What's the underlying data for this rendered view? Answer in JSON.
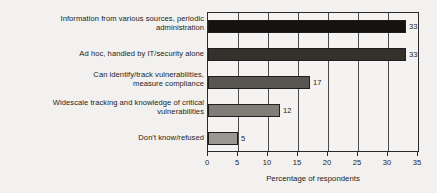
{
  "chart_data": {
    "type": "bar",
    "orientation": "horizontal",
    "title": "",
    "xlabel": "Percentage of respondents",
    "ylabel": "",
    "xlim": [
      0,
      35
    ],
    "xticks": [
      0,
      5,
      10,
      15,
      20,
      25,
      30,
      35
    ],
    "grid": "vertical",
    "legend": "none",
    "categories": [
      "Information from various sources, periodic administration",
      "Ad hoc, handled by IT/security alone",
      "Can identify/track vulnerabilities, measure compliance",
      "Widescale tracking and knowledge of critical vulnerabilities",
      "Don't know/refused"
    ],
    "category_lines": [
      [
        "Information from various sources, periodic",
        "administration"
      ],
      [
        "Ad hoc, handled by IT/security alone"
      ],
      [
        "Can identify/track vulnerabilities,",
        "measure compliance"
      ],
      [
        "Widescale tracking and knowledge of critical",
        "vulnerabilities"
      ],
      [
        "Don't know/refused"
      ]
    ],
    "values": [
      33,
      33,
      17,
      12,
      5
    ],
    "value_labels": [
      "33",
      "33",
      "17",
      "12",
      "5"
    ],
    "bar_colors": [
      "#15120f",
      "#34312d",
      "#595651",
      "#807d78",
      "#9b9893"
    ]
  }
}
